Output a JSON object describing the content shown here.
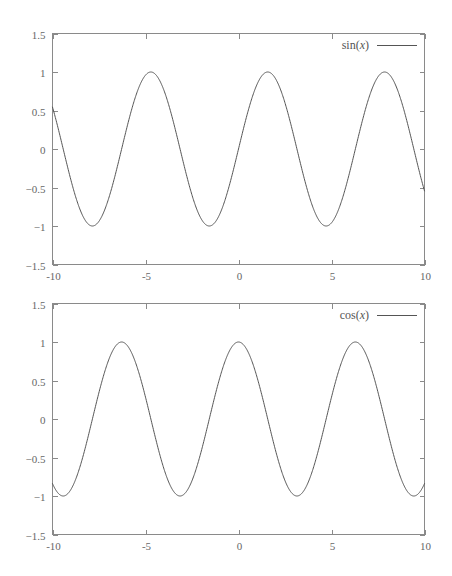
{
  "figure": {
    "title": "",
    "width": 452,
    "height": 576,
    "background_color": "#ffffff",
    "axis_color": "#8a8a8a",
    "curve_color": "#555555",
    "label_color": "#676767"
  },
  "panels": [
    {
      "name": "sin-panel",
      "legend_label": "sin(x)",
      "legend_func": "sin",
      "legend_var": "x"
    },
    {
      "name": "cos-panel",
      "legend_label": "cos(x)",
      "legend_func": "cos",
      "legend_var": "x"
    }
  ],
  "chart_data": [
    {
      "type": "line",
      "title": "",
      "xlabel": "",
      "ylabel": "",
      "xlim": [
        -10,
        10
      ],
      "ylim": [
        -1.5,
        1.5
      ],
      "xticks": [
        -10,
        -5,
        0,
        5,
        10
      ],
      "xtick_labels": [
        "-10",
        "-5",
        "0",
        "5",
        "10"
      ],
      "yticks": [
        -1.5,
        -1,
        -0.5,
        0,
        0.5,
        1,
        1.5
      ],
      "ytick_labels": [
        "-1.5",
        "-1",
        "-0.5",
        "0",
        "0.5",
        "1",
        "1.5"
      ],
      "grid": false,
      "legend_position": "top-right",
      "series": [
        {
          "name": "sin(x)",
          "function": "sin",
          "color": "#555555",
          "x": [
            -10,
            -9.5,
            -9,
            -8.5,
            -8,
            -7.5,
            -7,
            -6.5,
            -6,
            -5.5,
            -5,
            -4.5,
            -4,
            -3.5,
            -3,
            -2.5,
            -2,
            -1.5,
            -1,
            -0.5,
            0,
            0.5,
            1,
            1.5,
            2,
            2.5,
            3,
            3.5,
            4,
            4.5,
            5,
            5.5,
            6,
            6.5,
            7,
            7.5,
            8,
            8.5,
            9,
            9.5,
            10
          ],
          "values": [
            0.544,
            0.075,
            -0.412,
            -0.798,
            -0.989,
            -0.938,
            -0.657,
            -0.215,
            0.279,
            0.706,
            0.959,
            0.978,
            0.757,
            0.351,
            -0.141,
            -0.598,
            -0.909,
            -0.997,
            -0.841,
            -0.479,
            0,
            0.479,
            0.841,
            0.997,
            0.909,
            0.598,
            0.141,
            -0.351,
            -0.757,
            -0.978,
            -0.959,
            -0.706,
            -0.279,
            0.215,
            0.657,
            0.938,
            0.989,
            0.798,
            0.412,
            -0.075,
            -0.544
          ]
        }
      ]
    },
    {
      "type": "line",
      "title": "",
      "xlabel": "",
      "ylabel": "",
      "xlim": [
        -10,
        10
      ],
      "ylim": [
        -1.5,
        1.5
      ],
      "xticks": [
        -10,
        -5,
        0,
        5,
        10
      ],
      "xtick_labels": [
        "-10",
        "-5",
        "0",
        "5",
        "10"
      ],
      "yticks": [
        -1.5,
        -1,
        -0.5,
        0,
        0.5,
        1,
        1.5
      ],
      "ytick_labels": [
        "-1.5",
        "-1",
        "-0.5",
        "0",
        "0.5",
        "1",
        "1.5"
      ],
      "grid": false,
      "legend_position": "top-right",
      "series": [
        {
          "name": "cos(x)",
          "function": "cos",
          "color": "#555555",
          "x": [
            -10,
            -9.5,
            -9,
            -8.5,
            -8,
            -7.5,
            -7,
            -6.5,
            -6,
            -5.5,
            -5,
            -4.5,
            -4,
            -3.5,
            -3,
            -2.5,
            -2,
            -1.5,
            -1,
            -0.5,
            0,
            0.5,
            1,
            1.5,
            2,
            2.5,
            3,
            3.5,
            4,
            4.5,
            5,
            5.5,
            6,
            6.5,
            7,
            7.5,
            8,
            8.5,
            9,
            9.5,
            10
          ],
          "values": [
            -0.839,
            -0.997,
            -0.911,
            -0.602,
            -0.146,
            0.347,
            0.754,
            0.977,
            0.96,
            0.709,
            0.284,
            -0.211,
            -0.654,
            -0.936,
            -0.99,
            -0.801,
            -0.416,
            0.071,
            0.54,
            0.878,
            1,
            0.878,
            0.54,
            0.071,
            -0.416,
            -0.801,
            -0.99,
            -0.936,
            -0.654,
            -0.211,
            0.284,
            0.709,
            0.96,
            0.977,
            0.754,
            0.347,
            -0.146,
            -0.602,
            -0.911,
            -0.997,
            -0.839
          ]
        }
      ]
    }
  ]
}
